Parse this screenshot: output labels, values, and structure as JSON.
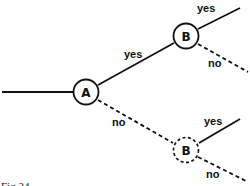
{
  "diagram": {
    "type": "decision-tree",
    "nodes": [
      {
        "id": "A",
        "label": "A",
        "style": "solid"
      },
      {
        "id": "B_upper",
        "label": "B",
        "style": "solid"
      },
      {
        "id": "B_lower",
        "label": "B",
        "style": "dashed"
      }
    ],
    "edges": [
      {
        "from": "input",
        "to": "A",
        "label": "",
        "style": "solid"
      },
      {
        "from": "A",
        "to": "B_upper",
        "label": "yes",
        "style": "solid"
      },
      {
        "from": "A",
        "to": "B_lower",
        "label": "no",
        "style": "dashed"
      },
      {
        "from": "B_upper",
        "to": "out_1",
        "label": "yes",
        "style": "solid"
      },
      {
        "from": "B_upper",
        "to": "out_2",
        "label": "no",
        "style": "dashed"
      },
      {
        "from": "B_lower",
        "to": "out_3",
        "label": "yes",
        "style": "solid"
      },
      {
        "from": "B_lower",
        "to": "out_4",
        "label": "no",
        "style": "dashed"
      }
    ],
    "caption": "Fig 24"
  }
}
